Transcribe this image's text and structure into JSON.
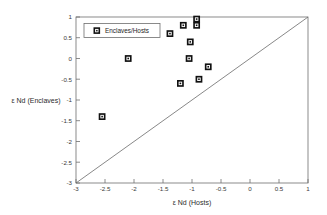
{
  "chart_data": {
    "type": "scatter",
    "title": "",
    "xlabel": "ε Nd (Hosts)",
    "ylabel": "ε Nd (Enclaves)",
    "xlim": [
      -3,
      1
    ],
    "ylim": [
      -3,
      1
    ],
    "xticks": [
      -3,
      -2.5,
      -2,
      -1.5,
      -1,
      -0.5,
      0,
      0.5,
      1
    ],
    "yticks": [
      -3,
      -2.5,
      -2,
      -1.5,
      -1,
      -0.5,
      0,
      0.5,
      1
    ],
    "xtick_labels": [
      "-3",
      "-2.5",
      "-2",
      "-1.5",
      "-1",
      "-0.5",
      "0",
      "0.5",
      "1"
    ],
    "ytick_labels": [
      "-3",
      "-2.5",
      "-2",
      "-1.5",
      "-1",
      "-0.5",
      "0",
      "0.5",
      "1"
    ],
    "grid": false,
    "legend_position": "upper-left",
    "series": [
      {
        "name": "Enclaves/Hosts",
        "marker": "square-x",
        "color": "#111111",
        "points": [
          {
            "x": -2.55,
            "y": -1.4
          },
          {
            "x": -2.1,
            "y": 0.0
          },
          {
            "x": -1.38,
            "y": 0.6
          },
          {
            "x": -1.15,
            "y": 0.8
          },
          {
            "x": -1.2,
            "y": -0.6
          },
          {
            "x": -1.03,
            "y": 0.4
          },
          {
            "x": -0.92,
            "y": 0.95
          },
          {
            "x": -0.92,
            "y": 0.8
          },
          {
            "x": -1.05,
            "y": 0.0
          },
          {
            "x": -0.88,
            "y": -0.5
          },
          {
            "x": -0.72,
            "y": -0.2
          }
        ]
      }
    ],
    "reference_line": {
      "name": "1:1 line",
      "from": {
        "x": -3,
        "y": -3
      },
      "to": {
        "x": 1,
        "y": 1
      }
    }
  },
  "legend": {
    "entries": [
      {
        "label": "Enclaves/Hosts"
      }
    ]
  },
  "axes": {
    "x_title": "ε Nd (Hosts)",
    "y_title": "ε Nd (Enclaves)"
  }
}
